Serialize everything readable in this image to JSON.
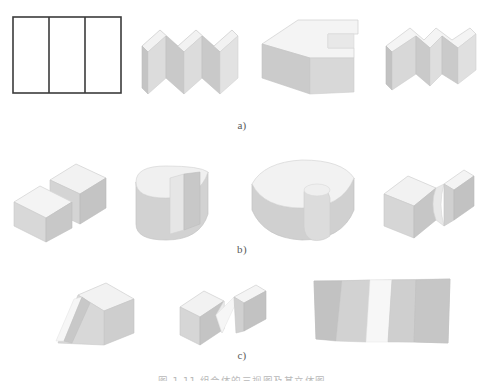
{
  "figure": {
    "caption": "图 1-11  组合体的三视图及其立体图",
    "rows": [
      {
        "id": "row-a",
        "label": "a)",
        "items": [
          {
            "name": "orthographic-three-panel-view",
            "kind": "orthographic",
            "description": "Rectangle divided by two vertical lines into three panels",
            "panels": 3
          },
          {
            "name": "zigzag-block",
            "kind": "solid",
            "description": "Accordion / zigzag folded block in isometric view"
          },
          {
            "name": "notched-block-rectangular",
            "kind": "solid",
            "description": "Rectangular block with a rectangular notch cut in the top face"
          },
          {
            "name": "v-notched-block",
            "kind": "solid",
            "description": "Rectangular block with a V shaped notch cut from the top"
          }
        ]
      },
      {
        "id": "row-b",
        "label": "b)",
        "items": [
          {
            "name": "stepped-diagonal-block",
            "kind": "solid",
            "description": "Block split by a diagonal step groove"
          },
          {
            "name": "half-cylinder-slotted",
            "kind": "solid",
            "description": "Half cylinder with a rectangular slot cut into the curved face"
          },
          {
            "name": "curved-block-with-cylinder",
            "kind": "solid",
            "description": "Curved block with a cylindrical protrusion at the front"
          },
          {
            "name": "block-with-curved-groove",
            "kind": "solid",
            "description": "Rectangular block with a curved groove cut through the top"
          }
        ]
      },
      {
        "id": "row-c",
        "label": "c)",
        "items": [
          {
            "name": "wedge-with-diagonal-groove",
            "kind": "solid",
            "description": "Wedge shaped block with a diagonal groove across the face"
          },
          {
            "name": "block-with-v-groove",
            "kind": "solid",
            "description": "Rectangular block with a V shaped groove through the top"
          },
          {
            "name": "wide-block-with-vertical-groove",
            "kind": "solid",
            "description": "Wide front facing block with a vertical groove"
          }
        ]
      }
    ]
  },
  "colors": {
    "outline": "#3b3b3b",
    "face_top": "#efefef",
    "face_front": "#d9d9d9",
    "face_side": "#c9c9c9",
    "face_light": "#f6f6f6",
    "face_dark": "#bdbdbd",
    "background": "#ffffff",
    "label_text": "#5a5a5a",
    "caption_text": "#b9b9b9"
  }
}
